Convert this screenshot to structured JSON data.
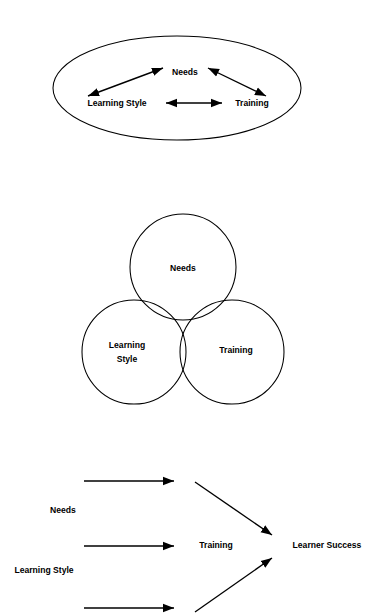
{
  "page": {
    "background_color": "#ffffff",
    "stroke_color": "#000000",
    "width": 377,
    "height": 616
  },
  "figures": [
    {
      "id": "ellipse-interrelation",
      "type": "ellipse-with-bidirectional-arrows",
      "shape_label": "ellipse",
      "nodes": [
        {
          "label": "Needs",
          "position": "top-center"
        },
        {
          "label": "Learning Style",
          "position": "bottom-left"
        },
        {
          "label": "Training",
          "position": "bottom-right"
        }
      ],
      "connectors": [
        {
          "from": "Learning Style",
          "to": "Needs",
          "style": "double-headed"
        },
        {
          "from": "Needs",
          "to": "Training",
          "style": "double-headed"
        },
        {
          "from": "Learning Style",
          "to": "Training",
          "style": "double-headed"
        }
      ]
    },
    {
      "id": "venn-overlap",
      "type": "venn-diagram-three-circles",
      "nodes": [
        {
          "label": "Needs",
          "position": "top"
        },
        {
          "label_line_1": "Learning",
          "label_line_2": "Style",
          "position": "bottom-left"
        },
        {
          "label": "Training",
          "position": "bottom-right"
        }
      ]
    },
    {
      "id": "flow-to-learner-success",
      "type": "convergent-flow",
      "inputs": [
        {
          "label": "Needs"
        },
        {
          "label": "Learning Style"
        },
        {
          "label": ""
        }
      ],
      "stages": [
        {
          "label": "Training"
        },
        {
          "label": "Learner Success"
        }
      ],
      "connectors": [
        {
          "style": "single-headed",
          "orientation": "horizontal",
          "row": 1
        },
        {
          "style": "single-headed",
          "orientation": "horizontal",
          "row": 2
        },
        {
          "style": "single-headed",
          "orientation": "horizontal",
          "row": 3
        },
        {
          "style": "single-headed",
          "orientation": "diagonal-down",
          "from": "Training",
          "to": "Learner Success"
        },
        {
          "style": "single-headed",
          "orientation": "diagonal-up",
          "from": "Training",
          "to": "Learner Success"
        }
      ]
    }
  ],
  "labels": {
    "needs": "Needs",
    "learning_style": "Learning Style",
    "learning": "Learning",
    "style": "Style",
    "training": "Training",
    "learner_success": "Learner Success"
  }
}
